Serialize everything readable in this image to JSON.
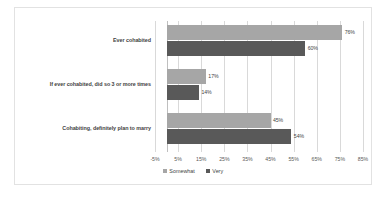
{
  "chart_data": {
    "type": "bar",
    "orientation": "horizontal",
    "title": "",
    "subtitle": "",
    "xlabel": "",
    "ylabel": "",
    "xlim": [
      -5,
      85
    ],
    "xtick_step": 10,
    "xticks": [
      "-5%",
      "5%",
      "15%",
      "25%",
      "35%",
      "45%",
      "55%",
      "65%",
      "75%",
      "85%"
    ],
    "xtick_values": [
      -5,
      5,
      15,
      25,
      35,
      45,
      55,
      65,
      75,
      85
    ],
    "grid": "vertical",
    "legend_position": "bottom-center",
    "categories": [
      "Ever cohabited",
      "If ever cohabited, did so 3 or more times",
      "Cohabiting, definitely plan to marry"
    ],
    "series": [
      {
        "name": "Somewhat",
        "color": "#a6a6a6",
        "values": [
          76,
          17,
          45
        ],
        "labels": [
          "76%",
          "17%",
          "45%"
        ]
      },
      {
        "name": "Very",
        "color": "#595959",
        "values": [
          60,
          14,
          54
        ],
        "labels": [
          "60%",
          "14%",
          "54%"
        ]
      }
    ]
  },
  "legend": {
    "items": [
      {
        "label": "Somewhat",
        "color": "#a6a6a6"
      },
      {
        "label": "Very",
        "color": "#595959"
      }
    ]
  },
  "colors": {
    "somewhat": "#a6a6a6",
    "very": "#595959",
    "gridline": "#d9d9d9",
    "axis": "#bfbfbf",
    "border": "#e2e2e2",
    "text": "#3f3f3f",
    "background": "#ffffff"
  }
}
